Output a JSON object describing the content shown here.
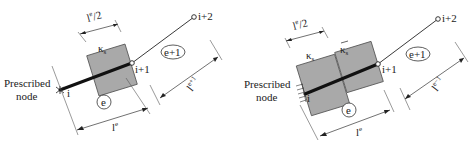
{
  "figure": {
    "left": {
      "prescribed_label_line1": "Prescribed",
      "prescribed_label_line2": "node",
      "node_i": "i",
      "node_i1": "i+1",
      "node_i2": "i+2",
      "half_length": "l",
      "half_length_sup": "e",
      "half_length_suffix": "/2",
      "kappa": "κ",
      "kappa_sub": "s",
      "elem_e": "e",
      "elem_e1": "e+1",
      "len_e": "l",
      "len_e_sup": "e",
      "len_e1": "l",
      "len_e1_sup": "e+1"
    },
    "right": {
      "prescribed_label_line1": "Prescribed",
      "prescribed_label_line2": "node",
      "node_i": "i",
      "node_i1": "i+1",
      "node_i2": "i+2",
      "half_length": "l",
      "half_length_sup": "e",
      "half_length_suffix": "/2",
      "kappa": "κ",
      "kappa_sub": "s",
      "kappa_bar": "κ̄",
      "kappa_bar_sub": "s",
      "elem_e": "e",
      "elem_e1": "e+1",
      "len_e": "l",
      "len_e_sup": "e",
      "len_e1": "l",
      "len_e1_sup": "e−1"
    },
    "colors": {
      "block_fill": "#a9a9a9",
      "beam": "#111111",
      "background": "#ffffff"
    }
  }
}
